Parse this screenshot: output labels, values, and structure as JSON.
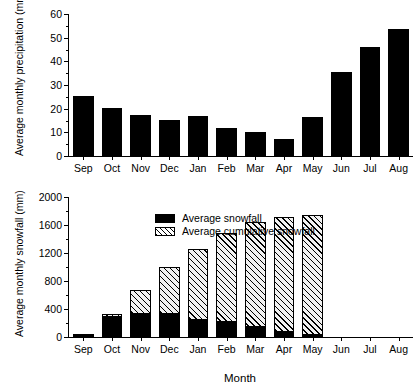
{
  "chart_data": [
    {
      "type": "bar",
      "panel": "top",
      "title": "",
      "xlabel": "",
      "ylabel": "Average monthly precipitation  (mm)",
      "categories": [
        "Sep",
        "Oct",
        "Nov",
        "Dec",
        "Jan",
        "Feb",
        "Mar",
        "Apr",
        "May",
        "Jun",
        "Jul",
        "Aug"
      ],
      "values": [
        25.5,
        20.2,
        17.4,
        15.3,
        17.0,
        11.9,
        10.1,
        7.0,
        16.5,
        35.7,
        46.0,
        53.8
      ],
      "ylim": [
        0,
        60
      ],
      "yticks": [
        0,
        10,
        20,
        30,
        40,
        50,
        60
      ],
      "yticks_minor": [
        5,
        15,
        25,
        35,
        45,
        55
      ],
      "grid": false,
      "legend": null,
      "series": [
        {
          "name": "Average monthly precipitation",
          "color": "#000000",
          "values": [
            25.5,
            20.2,
            17.4,
            15.3,
            17.0,
            11.9,
            10.1,
            7.0,
            16.5,
            35.7,
            46.0,
            53.8
          ]
        }
      ]
    },
    {
      "type": "bar",
      "panel": "bottom",
      "stacked": true,
      "title": "",
      "xlabel": "Month",
      "ylabel": "Average monthly snowfall (mm)",
      "categories": [
        "Sep",
        "Oct",
        "Nov",
        "Dec",
        "Jan",
        "Feb",
        "Mar",
        "Apr",
        "May",
        "Jun",
        "Jul",
        "Aug"
      ],
      "ylim": [
        0,
        2000
      ],
      "yticks": [
        0,
        400,
        800,
        1200,
        1600,
        2000
      ],
      "yticks_minor": [
        200,
        600,
        1000,
        1400,
        1800
      ],
      "grid": false,
      "legend_position": "top-left",
      "series": [
        {
          "name": "Average snowfall",
          "color": "#000000",
          "fill": "solid",
          "values": [
            40,
            295,
            350,
            350,
            260,
            230,
            155,
            90,
            45,
            0,
            0,
            0
          ]
        },
        {
          "name": "Average cumulative snowfall",
          "color": "#000000",
          "fill": "hatched",
          "values": [
            0,
            330,
            670,
            1005,
            1255,
            1490,
            1640,
            1720,
            1750,
            0,
            0,
            0
          ]
        }
      ]
    }
  ],
  "panels": {
    "top": {
      "y_axis_title": "Average monthly precipitation  (mm)",
      "y_tick_labels": [
        "60",
        "50",
        "40",
        "30",
        "20",
        "10",
        "0"
      ],
      "x_tick_labels": [
        "Sep",
        "Oct",
        "Nov",
        "Dec",
        "Jan",
        "Feb",
        "Mar",
        "Apr",
        "May",
        "Jun",
        "Jul",
        "Aug"
      ]
    },
    "bottom": {
      "y_axis_title": "Average monthly snowfall (mm)",
      "y_tick_labels": [
        "2000",
        "1600",
        "1200",
        "800",
        "400",
        "0"
      ],
      "x_tick_labels": [
        "Sep",
        "Oct",
        "Nov",
        "Dec",
        "Jan",
        "Feb",
        "Mar",
        "Apr",
        "May",
        "Jun",
        "Jul",
        "Aug"
      ],
      "x_axis_title": "Month",
      "legend": [
        {
          "label": "Average snowfall",
          "swatch": "solid-black-swatch"
        },
        {
          "label": "Average cumulative snowfall",
          "swatch": "hatched-swatch"
        }
      ]
    }
  }
}
